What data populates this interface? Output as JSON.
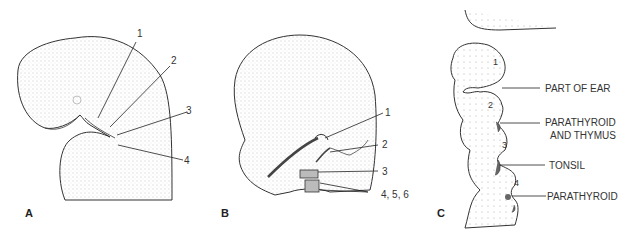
{
  "panels": [
    {
      "id": "A",
      "letter": "A",
      "labels": [
        "1",
        "2",
        "3",
        "4"
      ]
    },
    {
      "id": "B",
      "letter": "B",
      "labels": [
        "1",
        "2",
        "3",
        "4, 5, 6"
      ]
    },
    {
      "id": "C",
      "letter": "C",
      "pouch_numbers": [
        "1",
        "2",
        "3",
        "4"
      ],
      "labels": [
        "PART OF EAR",
        "PARATHYROID",
        "AND THYMUS",
        "TONSIL",
        "PARATHYROID"
      ]
    }
  ],
  "colors": {
    "stipple": "#555555",
    "line": "#222222",
    "shaded": "#666666"
  }
}
